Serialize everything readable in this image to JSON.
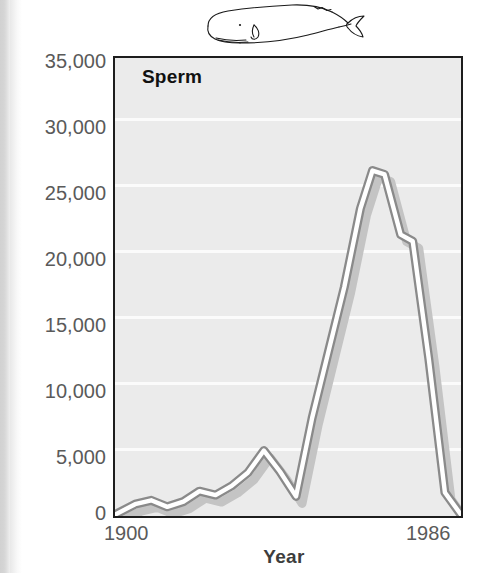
{
  "figure": {
    "series_label": "Sperm",
    "illustration": "sperm-whale-line-drawing"
  },
  "chart_data": {
    "type": "line",
    "title": "Sperm",
    "xlabel": "Year",
    "ylabel": "",
    "xlim": [
      1900,
      1986
    ],
    "ylim": [
      0,
      35000
    ],
    "ytick_labels": [
      "35,000",
      "30,000",
      "25,000",
      "20,000",
      "15,000",
      "10,000",
      "5,000",
      "0"
    ],
    "yticks": [
      35000,
      30000,
      25000,
      20000,
      15000,
      10000,
      5000,
      0
    ],
    "xtick_labels": [
      "1900",
      "1986"
    ],
    "xticks": [
      1900,
      1986
    ],
    "grid": "horizontal-white-gridlines",
    "legend": "none",
    "series": [
      {
        "name": "Sperm",
        "x": [
          1900,
          1905,
          1909,
          1913,
          1917,
          1921,
          1925,
          1929,
          1933,
          1937,
          1941,
          1945,
          1949,
          1953,
          1957,
          1961,
          1964,
          1967,
          1971,
          1974,
          1978,
          1982,
          1986
        ],
        "values": [
          100,
          900,
          1200,
          700,
          1100,
          1900,
          1600,
          2300,
          3300,
          5000,
          3400,
          1500,
          7500,
          12500,
          17500,
          23500,
          26400,
          26100,
          21500,
          21000,
          12000,
          1800,
          100
        ]
      }
    ]
  },
  "axis": {
    "y_labels": [
      "35,000",
      "30,000",
      "25,000",
      "20,000",
      "15,000",
      "10,000",
      "5,000",
      "0"
    ],
    "x_start": "1900",
    "x_end": "1986",
    "x_title": "Year"
  },
  "colors": {
    "plot_background": "#ebebeb",
    "gridline": "#fbfbfb",
    "axis_border": "#1d1d1d",
    "line_core": "#ffffff",
    "line_edge": "#8d8d8d",
    "line_shadow": "#c3c3c3",
    "tick_text": "#5a5a5a",
    "label_text": "#111111"
  }
}
